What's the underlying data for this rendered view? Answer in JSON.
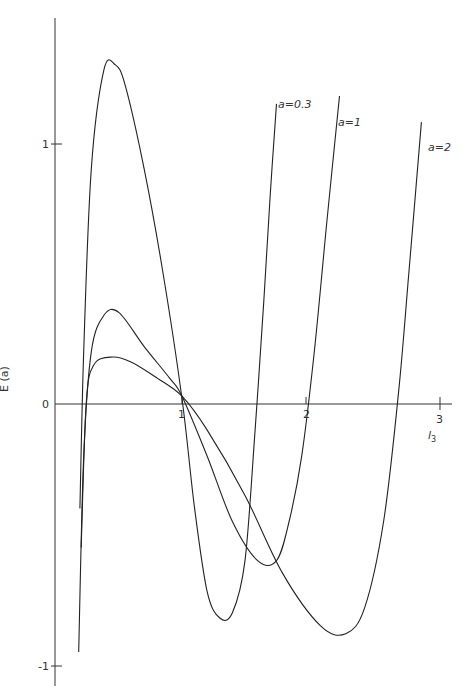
{
  "chart_data": {
    "type": "line",
    "title": "",
    "xlabel": "l3",
    "ylabel": "E (a)",
    "xlim": [
      0,
      3.1
    ],
    "ylim": [
      -1.05,
      1.45
    ],
    "grid": false,
    "x_ticks": [
      "1",
      "2",
      "3"
    ],
    "y_ticks": [
      "1",
      "0",
      "-1"
    ],
    "legend": "inline labels at curve ends",
    "series": [
      {
        "name": "a=0.3",
        "x": [
          0.19,
          0.22,
          0.28,
          0.38,
          0.47,
          0.55,
          0.7,
          0.85,
          1.0,
          1.1,
          1.2,
          1.3,
          1.4,
          1.5,
          1.58,
          1.65,
          1.7,
          1.75
        ],
        "y": [
          -0.4,
          0.2,
          0.9,
          1.28,
          1.3,
          1.22,
          0.9,
          0.5,
          0.02,
          -0.4,
          -0.72,
          -0.82,
          -0.8,
          -0.6,
          -0.1,
          0.4,
          0.8,
          1.15
        ]
      },
      {
        "name": "a=1",
        "x": [
          0.18,
          0.22,
          0.28,
          0.38,
          0.5,
          0.7,
          0.9,
          1.0,
          1.2,
          1.4,
          1.6,
          1.75,
          1.85,
          1.95,
          2.05,
          2.15,
          2.25
        ],
        "y": [
          -0.95,
          -0.2,
          0.2,
          0.34,
          0.35,
          0.22,
          0.1,
          0.03,
          -0.2,
          -0.45,
          -0.6,
          -0.6,
          -0.45,
          -0.2,
          0.2,
          0.7,
          1.18
        ]
      },
      {
        "name": "a=2",
        "x": [
          0.2,
          0.24,
          0.3,
          0.45,
          0.6,
          0.8,
          1.0,
          1.2,
          1.5,
          1.8,
          2.1,
          2.3,
          2.45,
          2.6,
          2.72,
          2.8,
          2.9
        ],
        "y": [
          -0.55,
          0.0,
          0.15,
          0.18,
          0.16,
          0.1,
          0.03,
          -0.1,
          -0.35,
          -0.65,
          -0.85,
          -0.88,
          -0.78,
          -0.45,
          0.05,
          0.5,
          1.08
        ]
      }
    ]
  },
  "labels": {
    "y_axis": "E (a)",
    "x_axis": "l",
    "x_axis_sub": "3",
    "tick_y_1": "1",
    "tick_y_0": "0",
    "tick_y_m1": "-1",
    "tick_x_1": "1",
    "tick_x_2": "2",
    "tick_x_3": "3",
    "curve_03": "a=0.3",
    "curve_1": "a=1",
    "curve_2": "a=2"
  }
}
